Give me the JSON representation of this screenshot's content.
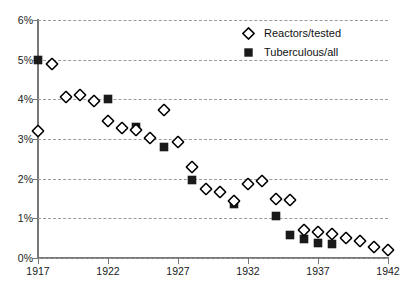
{
  "chart_data": {
    "type": "scatter",
    "title": "",
    "xlabel": "",
    "ylabel": "",
    "xlim": [
      1917,
      1942
    ],
    "ylim": [
      0,
      6
    ],
    "grid": true,
    "legend_position": "top-right",
    "y_tick_labels": [
      "6%",
      "5%",
      "4%",
      "3%",
      "2%",
      "1%",
      "0%"
    ],
    "y_tick_values": [
      6,
      5,
      4,
      3,
      2,
      1,
      0
    ],
    "x_tick_labels": [
      "1917",
      "1922",
      "1927",
      "1932",
      "1937",
      "1942"
    ],
    "x_tick_values": [
      1917,
      1922,
      1927,
      1932,
      1937,
      1942
    ],
    "series": [
      {
        "name": "Reactors/tested",
        "marker": "open-diamond",
        "color": "#000000",
        "points": [
          {
            "x": 1917,
            "y": 3.2
          },
          {
            "x": 1918,
            "y": 4.88
          },
          {
            "x": 1919,
            "y": 4.06
          },
          {
            "x": 1920,
            "y": 4.1
          },
          {
            "x": 1921,
            "y": 3.95
          },
          {
            "x": 1922,
            "y": 3.45
          },
          {
            "x": 1923,
            "y": 3.28
          },
          {
            "x": 1924,
            "y": 3.22
          },
          {
            "x": 1925,
            "y": 3.02
          },
          {
            "x": 1926,
            "y": 3.72
          },
          {
            "x": 1927,
            "y": 2.93
          },
          {
            "x": 1928,
            "y": 2.3
          },
          {
            "x": 1929,
            "y": 1.74
          },
          {
            "x": 1930,
            "y": 1.66
          },
          {
            "x": 1931,
            "y": 1.43
          },
          {
            "x": 1932,
            "y": 1.86
          },
          {
            "x": 1933,
            "y": 1.94
          },
          {
            "x": 1934,
            "y": 1.49
          },
          {
            "x": 1935,
            "y": 1.46
          },
          {
            "x": 1936,
            "y": 0.71
          },
          {
            "x": 1937,
            "y": 0.65
          },
          {
            "x": 1938,
            "y": 0.6
          },
          {
            "x": 1939,
            "y": 0.5
          },
          {
            "x": 1940,
            "y": 0.43
          },
          {
            "x": 1941,
            "y": 0.28
          },
          {
            "x": 1942,
            "y": 0.2
          }
        ]
      },
      {
        "name": "Tuberculous/all",
        "marker": "filled-square",
        "color": "#1a1a1a",
        "points": [
          {
            "x": 1917,
            "y": 5.0
          },
          {
            "x": 1922,
            "y": 4.0
          },
          {
            "x": 1924,
            "y": 3.3
          },
          {
            "x": 1926,
            "y": 2.79
          },
          {
            "x": 1928,
            "y": 1.97
          },
          {
            "x": 1931,
            "y": 1.36
          },
          {
            "x": 1934,
            "y": 1.06
          },
          {
            "x": 1935,
            "y": 0.57
          },
          {
            "x": 1936,
            "y": 0.49
          },
          {
            "x": 1937,
            "y": 0.37
          },
          {
            "x": 1938,
            "y": 0.36
          }
        ]
      }
    ]
  },
  "legend": {
    "items": [
      {
        "label": "Reactors/tested",
        "marker": "open-diamond"
      },
      {
        "label": "Tuberculous/all",
        "marker": "filled-square"
      }
    ]
  }
}
